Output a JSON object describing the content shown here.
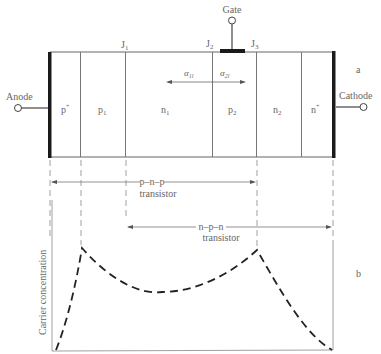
{
  "figure": {
    "panel_a_label": "a",
    "panel_b_label": "b",
    "terminals": {
      "anode": "Anode",
      "cathode": "Cathode",
      "gate": "Gate"
    },
    "junctions": {
      "j1": "J",
      "j1_sub": "1",
      "j2": "J",
      "j2_sub": "2",
      "j3": "J",
      "j3_sub": "3"
    },
    "regions": [
      {
        "name": "p",
        "sup": "+",
        "sub": ""
      },
      {
        "name": "p",
        "sup": "",
        "sub": "1"
      },
      {
        "name": "n",
        "sup": "",
        "sub": "1"
      },
      {
        "name": "p",
        "sup": "",
        "sub": "2"
      },
      {
        "name": "n",
        "sup": "",
        "sub": "2"
      },
      {
        "name": "n",
        "sup": "+",
        "sub": ""
      }
    ],
    "alphas": {
      "alpha1": "α",
      "alpha1_sub": "1l",
      "alpha2": "α",
      "alpha2_sub": "2l"
    },
    "transistors": {
      "pnp_line1": "p–n–p",
      "pnp_line2": "transistor",
      "npn_line1": "n–p–n",
      "npn_line2": "transistor"
    },
    "plot": {
      "ylabel": "Carrier concentration"
    },
    "colors": {
      "line": "#555555",
      "thick": "#1a1a1a",
      "curve": "#222222"
    }
  }
}
